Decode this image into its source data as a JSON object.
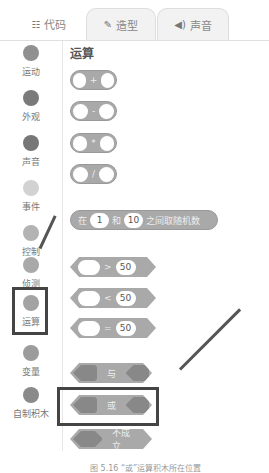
{
  "tabs": [
    {
      "icon": "code-icon",
      "glyph": "☷",
      "label": "代码"
    },
    {
      "icon": "brush-icon",
      "glyph": "✎",
      "label": "造型"
    },
    {
      "icon": "speaker-icon",
      "glyph": "◀)",
      "label": "声音"
    }
  ],
  "sidebar": {
    "items": [
      {
        "label": "运动",
        "color": "#909090"
      },
      {
        "label": "外观",
        "color": "#7a7a7a"
      },
      {
        "label": "声音",
        "color": "#777777"
      },
      {
        "label": "事件",
        "color": "#d2d2d2"
      },
      {
        "label": "控制",
        "color": "#b3b3b3"
      },
      {
        "label": "侦测",
        "color": "#a9a9a9"
      },
      {
        "label": "运算",
        "color": "#a3a3a3"
      },
      {
        "label": "变量",
        "color": "#9c9c9c"
      },
      {
        "label": "自制积木",
        "color": "#8a8a8a"
      }
    ]
  },
  "palette": {
    "title": "运算",
    "arith": [
      "+",
      "-",
      "*",
      "/"
    ],
    "random": {
      "pre": "在",
      "a": "1",
      "mid": "和",
      "b": "10",
      "post": "之间取随机数"
    },
    "compare": [
      {
        "op": ">",
        "val": "50"
      },
      {
        "op": "<",
        "val": "50"
      },
      {
        "op": "=",
        "val": "50"
      }
    ],
    "bool": [
      "与",
      "或",
      "不成立"
    ]
  },
  "caption": "图 5.16 “或”运算积木所在位置"
}
